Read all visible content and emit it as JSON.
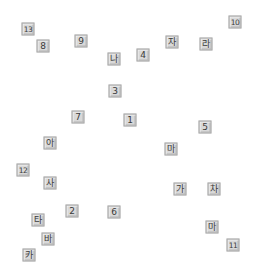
{
  "canvas": {
    "background": "#ffffff",
    "tile_color": "#d9d9d9",
    "tile_border": "#a8a8a8",
    "text_color": "#3a3a3a"
  },
  "tiles": [
    {
      "label": "13",
      "x": 28,
      "y": 29
    },
    {
      "label": "8",
      "x": 43,
      "y": 46
    },
    {
      "label": "9",
      "x": 81,
      "y": 41
    },
    {
      "label": "나",
      "x": 114,
      "y": 59
    },
    {
      "label": "4",
      "x": 143,
      "y": 55
    },
    {
      "label": "자",
      "x": 172,
      "y": 42
    },
    {
      "label": "라",
      "x": 206,
      "y": 44
    },
    {
      "label": "10",
      "x": 235,
      "y": 22
    },
    {
      "label": "3",
      "x": 115,
      "y": 91
    },
    {
      "label": "7",
      "x": 78,
      "y": 117
    },
    {
      "label": "1",
      "x": 130,
      "y": 120
    },
    {
      "label": "5",
      "x": 205,
      "y": 127
    },
    {
      "label": "아",
      "x": 50,
      "y": 143
    },
    {
      "label": "마",
      "x": 171,
      "y": 149
    },
    {
      "label": "12",
      "x": 23,
      "y": 170
    },
    {
      "label": "사",
      "x": 50,
      "y": 183
    },
    {
      "label": "가",
      "x": 180,
      "y": 189
    },
    {
      "label": "차",
      "x": 214,
      "y": 189
    },
    {
      "label": "2",
      "x": 72,
      "y": 211
    },
    {
      "label": "6",
      "x": 114,
      "y": 212
    },
    {
      "label": "타",
      "x": 38,
      "y": 220
    },
    {
      "label": "바",
      "x": 48,
      "y": 239
    },
    {
      "label": "카",
      "x": 29,
      "y": 255
    },
    {
      "label": "마",
      "x": 212,
      "y": 227
    },
    {
      "label": "11",
      "x": 233,
      "y": 245
    }
  ]
}
